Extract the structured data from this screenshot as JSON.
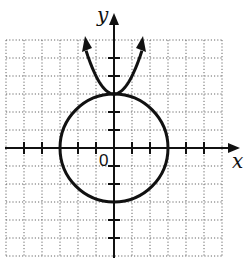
{
  "diagram": {
    "title": "",
    "x_axis_label": "x",
    "y_axis_label": "y",
    "origin_label": "0",
    "grid": {
      "x_min": -6,
      "x_max": 6,
      "y_min": -6,
      "y_max": 6,
      "step": 1,
      "style": "dotted"
    },
    "curves": [
      {
        "type": "circle",
        "center": [
          0,
          0
        ],
        "radius": 3,
        "equation": "x^2 + y^2 = 9"
      },
      {
        "type": "parabola",
        "vertex": [
          0,
          3
        ],
        "opens": "up",
        "arrows": true
      }
    ],
    "colors": {
      "curve": "#111111",
      "grid": "#555555",
      "axis": "#111111"
    }
  }
}
